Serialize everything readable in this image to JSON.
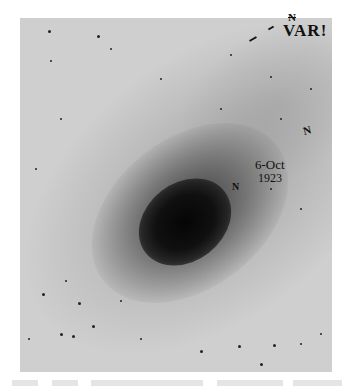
{
  "image": {
    "description": "Astronomical photographic plate of a spiral nebula (galaxy) with handwritten annotations",
    "colors": {
      "background": "#cfcfcf",
      "core": "#050505",
      "ink": "#111111"
    }
  },
  "annotations": {
    "var_label": "VAR!",
    "n_top": "N",
    "date_line1": "6-Oct",
    "date_line2": "1923",
    "n_core": "N",
    "n_right": "N"
  },
  "caption": {
    "text": ""
  }
}
